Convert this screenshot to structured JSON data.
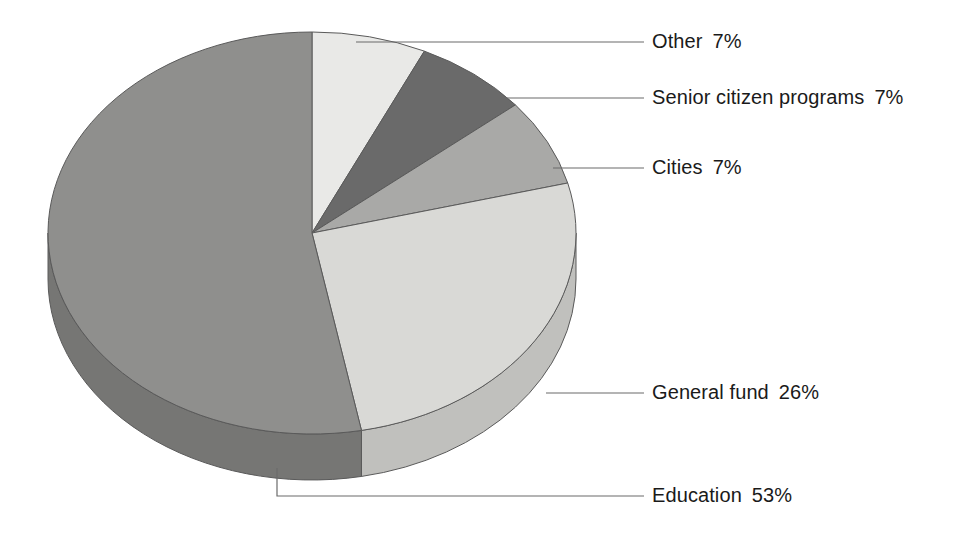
{
  "chart_data": {
    "type": "pie",
    "title": "",
    "subtitle": "",
    "xlabel": "",
    "ylabel": "",
    "legend_position": "callout-labels-right",
    "grid": false,
    "style": "3d-exploded-none",
    "units": "percent",
    "categories": [
      "Education",
      "General fund",
      "Cities",
      "Senior citizen programs",
      "Other"
    ],
    "values": [
      53,
      26,
      7,
      7,
      7
    ],
    "labels": [
      "Education  53%",
      "General fund  26%",
      "Cities  7%",
      "Senior citizen programs  7%",
      "Other  7%"
    ],
    "slices": [
      {
        "name": "Other",
        "label": "Other",
        "value": 7,
        "percent_text": "7%",
        "color": "#e9e9e7",
        "side_color": "#d2d2d0",
        "start_angle": 0,
        "end_angle": 25.2
      },
      {
        "name": "Senior citizen programs",
        "label": "Senior citizen programs",
        "value": 7,
        "percent_text": "7%",
        "color": "#6a6a6a",
        "side_color": "#555555",
        "start_angle": 25.2,
        "end_angle": 50.4
      },
      {
        "name": "Cities",
        "label": "Cities",
        "value": 7,
        "percent_text": "7%",
        "color": "#a9a9a7",
        "side_color": "#8f8f8d",
        "start_angle": 50.4,
        "end_angle": 75.6
      },
      {
        "name": "General fund",
        "label": "General fund",
        "value": 26,
        "percent_text": "26%",
        "color": "#d9d9d6",
        "side_color": "#c0c0bd",
        "start_angle": 75.6,
        "end_angle": 169.2
      },
      {
        "name": "Education",
        "label": "Education",
        "value": 53,
        "percent_text": "53%",
        "color": "#8f8f8d",
        "side_color": "#767674",
        "start_angle": 169.2,
        "end_angle": 360
      }
    ],
    "callouts": [
      {
        "name": "Other",
        "label": "Other",
        "percent_text": "7%",
        "text": "Other  7%"
      },
      {
        "name": "Senior citizen programs",
        "label": "Senior citizen programs",
        "percent_text": "7%",
        "text": "Senior citizen programs  7%"
      },
      {
        "name": "Cities",
        "label": "Cities",
        "percent_text": "7%",
        "text": "Cities  7%"
      },
      {
        "name": "General fund",
        "label": "General fund",
        "percent_text": "26%",
        "text": "General fund  26%"
      },
      {
        "name": "Education",
        "label": "Education",
        "percent_text": "53%",
        "text": "Education  53%"
      }
    ],
    "colors": {
      "other": "#e9e9e7",
      "senior_citizen_programs": "#6a6a6a",
      "cities": "#a9a9a7",
      "general_fund": "#d9d9d6",
      "education": "#8f8f8d",
      "background": "#ffffff",
      "leader_line": "#6b6b6b",
      "text": "#1a1a1a",
      "slice_outline": "#5a5a5a"
    },
    "geometry": {
      "center_x": 312,
      "center_y": 233,
      "radius_x": 264,
      "radius_y": 201,
      "depth": 46
    }
  }
}
